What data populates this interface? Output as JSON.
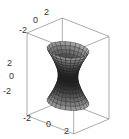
{
  "chart_data": {
    "type": "surface3d",
    "title": "",
    "surface": "hyperboloid of one sheet",
    "equation": "x^2 + y^2 - z^2 = 1",
    "parametrization": {
      "u_range": [
        0,
        6.2832
      ],
      "v_range": [
        -1.9,
        1.9
      ],
      "u_steps": 24,
      "v_steps": 16
    },
    "axes": {
      "x": {
        "ticks": [
          "-2",
          "0",
          "2"
        ],
        "range": [
          -3,
          3
        ]
      },
      "y": {
        "ticks": [
          "-2",
          "0",
          "2"
        ],
        "range": [
          -3,
          3
        ]
      },
      "z": {
        "ticks": [
          "-2",
          "0",
          "2"
        ],
        "range": [
          -3,
          3
        ]
      }
    },
    "box": true,
    "grid": false,
    "legend": null,
    "colors": {
      "surface_light": "#c8c8c8",
      "surface_dark": "#1a1a1a",
      "mesh": "#222222",
      "box": "#888888"
    }
  }
}
